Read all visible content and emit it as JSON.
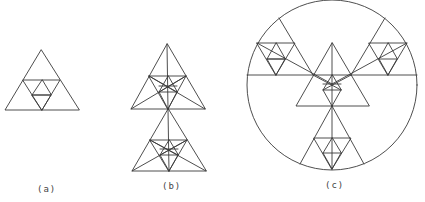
{
  "figure": {
    "labels": {
      "a": "(a)",
      "b": "(b)",
      "c": "(c)"
    },
    "stroke_color": "#3a3a3a",
    "background": "#ffffff"
  }
}
